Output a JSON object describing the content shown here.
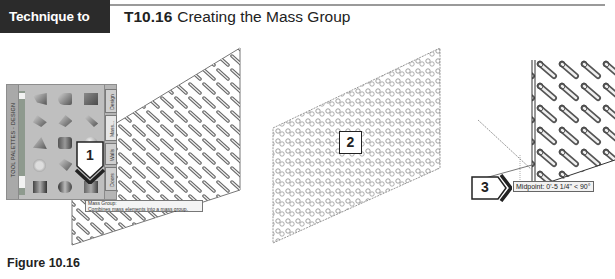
{
  "header": {
    "tag_label": "Technique to Master",
    "technique_number": "T10.16",
    "technique_title": "Creating the Mass Group"
  },
  "palette": {
    "title": "TOOL PALETTES - DESIGN",
    "tabs": [
      {
        "label": "Design"
      },
      {
        "label": "Mass..."
      },
      {
        "label": "Walls"
      },
      {
        "label": "Doors"
      }
    ],
    "tools": [
      {
        "icon": "arch-shape-icon"
      },
      {
        "icon": "barrel-vault-shape-icon"
      },
      {
        "icon": "box-shape-icon"
      },
      {
        "icon": "gable-shape-icon"
      },
      {
        "icon": "dome-shape-icon"
      },
      {
        "icon": "extrusion-shape-icon"
      },
      {
        "icon": "pyramid-shape-icon"
      },
      {
        "icon": "cylinder-shape-icon"
      },
      {
        "icon": "sphere-shape-icon"
      },
      {
        "icon": "isosceles-triangle-shape-icon"
      },
      {
        "icon": "cone-shape-icon"
      },
      {
        "icon": "revolution-shape-icon"
      },
      {
        "icon": "free-form-shape-icon"
      },
      {
        "icon": "doric-shape-icon"
      },
      {
        "icon": "mass-group-icon"
      }
    ]
  },
  "tooltip": {
    "title": "Mass Group:",
    "description": "Combines mass elements into a mass group."
  },
  "callouts": [
    {
      "number": "1"
    },
    {
      "number": "2"
    },
    {
      "number": "3"
    }
  ],
  "snap_tooltip": {
    "text": "Midpoint: 0'-5 1/4\" < 90°"
  },
  "caption": "Figure 10.16"
}
